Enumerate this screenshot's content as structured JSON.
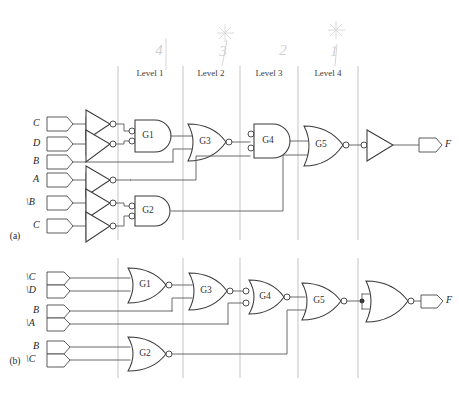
{
  "figure": {
    "subfigures": [
      {
        "key": "a",
        "label": "(a)"
      },
      {
        "key": "b",
        "label": "(b)"
      }
    ]
  },
  "levels": {
    "labels": [
      "Level 1",
      "Level 2",
      "Level 3",
      "Level 4"
    ],
    "divider_x": [
      118,
      183,
      240,
      298,
      358
    ]
  },
  "annotations": {
    "handwritten_numbers": [
      "4",
      "3",
      "2",
      "1"
    ],
    "handwritten_marks": [
      "asterisk",
      "asterisk"
    ]
  },
  "circuit_a": {
    "caption": "(a)",
    "inputs": [
      {
        "name": "C",
        "label": "C",
        "y": 124
      },
      {
        "name": "D",
        "label": "D",
        "y": 144
      },
      {
        "name": "B",
        "label": "B",
        "y": 162
      },
      {
        "name": "A",
        "label": "A",
        "y": 180
      },
      {
        "name": "nB",
        "label": "\\B",
        "y": 203
      },
      {
        "name": "C2",
        "label": "C",
        "y": 226
      }
    ],
    "gates": [
      {
        "name": "G1",
        "label": "G1",
        "type": "and-inverted-inputs",
        "level": 1
      },
      {
        "name": "G2",
        "label": "G2",
        "type": "and-inverted-inputs",
        "level": 1
      },
      {
        "name": "G3",
        "label": "G3",
        "type": "nor",
        "level": 2
      },
      {
        "name": "G4",
        "label": "G4",
        "type": "and-inverted-inputs",
        "level": 3
      },
      {
        "name": "G5",
        "label": "G5",
        "type": "nor",
        "level": 4
      },
      {
        "name": "OUTINV",
        "label": "",
        "type": "inverter",
        "level": 5
      }
    ],
    "inverters": 4,
    "output": {
      "name": "F",
      "label": "F"
    }
  },
  "circuit_b": {
    "caption": "(b)",
    "inputs": [
      {
        "name": "nC",
        "label": "\\C",
        "y": 278
      },
      {
        "name": "nD",
        "label": "\\D",
        "y": 291
      },
      {
        "name": "B",
        "label": "B",
        "y": 311
      },
      {
        "name": "nA",
        "label": "\\A",
        "y": 324
      },
      {
        "name": "B2",
        "label": "B",
        "y": 347
      },
      {
        "name": "nC2",
        "label": "\\C",
        "y": 360
      }
    ],
    "gates": [
      {
        "name": "G1",
        "label": "G1",
        "type": "nor",
        "level": 1
      },
      {
        "name": "G2",
        "label": "G2",
        "type": "nor",
        "level": 1
      },
      {
        "name": "G3",
        "label": "G3",
        "type": "nor",
        "level": 2
      },
      {
        "name": "G4",
        "label": "G4",
        "type": "nor-inverted-inputs",
        "level": 3
      },
      {
        "name": "G5",
        "label": "G5",
        "type": "nor",
        "level": 4
      },
      {
        "name": "OUTNOR",
        "label": "",
        "type": "nor-as-inverter",
        "level": 5
      }
    ],
    "output": {
      "name": "F",
      "label": "F"
    }
  },
  "colors": {
    "wire": "#5a5a5a",
    "gate_outline": "#3a3a3a",
    "divider": "#b9b9b9",
    "text": "#1f1f1f",
    "handwriting": "#cfcfcf",
    "background": "#ffffff"
  }
}
